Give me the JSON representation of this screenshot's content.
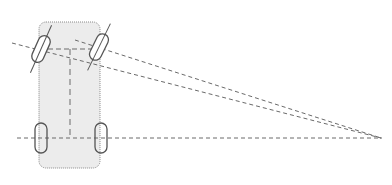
{
  "diagram": {
    "colors": {
      "background": "#ffffff",
      "body_fill": "#ececec",
      "body_border": "#8a8a8a",
      "stroke": "#555555",
      "dash": "#6a6a6a"
    },
    "elements": [
      "vehicle-body",
      "front-left-wheel",
      "front-right-wheel",
      "rear-left-wheel",
      "rear-right-wheel",
      "rear-axle-extension-line",
      "front-left-wheel-axis-line",
      "front-right-wheel-axis-line",
      "front-axle-line",
      "center-line",
      "turn-center-point"
    ]
  }
}
